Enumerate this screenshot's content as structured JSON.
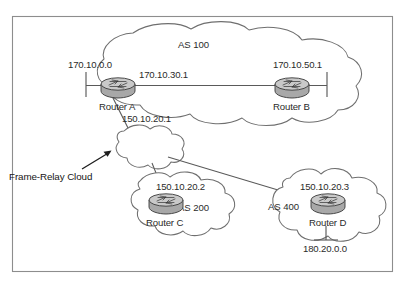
{
  "figure": {
    "background_color": "#ffffff",
    "border_color": "#8d8d8d",
    "line_color": "#5a5a5a",
    "text_color": "#2b2b2b",
    "router_fill": "#a8a8a8"
  },
  "clouds": [
    {
      "id": "as100",
      "label": "AS 100",
      "kind": "autonomous-system"
    },
    {
      "id": "frame-relay",
      "label": "",
      "kind": "frame-relay-cloud"
    },
    {
      "id": "as200",
      "label": "AS 200",
      "kind": "autonomous-system"
    },
    {
      "id": "as400",
      "label": "AS 400",
      "kind": "autonomous-system"
    }
  ],
  "routers": [
    {
      "id": "router-a",
      "name": "Router A"
    },
    {
      "id": "router-b",
      "name": "Router B"
    },
    {
      "id": "router-c",
      "name": "Router C"
    },
    {
      "id": "router-d",
      "name": "Router D"
    }
  ],
  "addresses": {
    "router_a_network": "170.10.0.0",
    "router_a_interface": "170.10.30.1",
    "router_a_serial": "150.10.20.1",
    "router_b_interface": "170.10.50.1",
    "router_c_interface": "150.10.20.2",
    "router_d_interface": "150.10.20.3",
    "router_d_network": "180.20.0.0"
  },
  "callout": {
    "label": "Frame-Relay Cloud",
    "icon": "arrow-up-right-icon"
  },
  "links": [
    {
      "from": "router-a",
      "to": "router-b",
      "kind": "ibgp-ethernet"
    },
    {
      "from": "router-a",
      "to": "frame-relay",
      "kind": "serial"
    },
    {
      "from": "frame-relay",
      "to": "router-c",
      "kind": "serial"
    },
    {
      "from": "frame-relay",
      "to": "router-d",
      "kind": "serial"
    }
  ]
}
